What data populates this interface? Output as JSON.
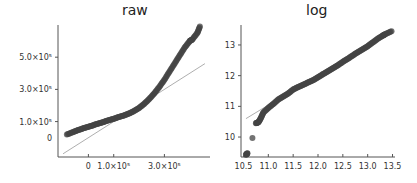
{
  "chart_data": [
    {
      "type": "scatter",
      "title": "raw",
      "subtype": "qq-plot",
      "xlabel": "",
      "ylabel": "",
      "xticks": [
        {
          "label": "0",
          "value": 0
        },
        {
          "label": "1.0×10⁵",
          "value": 100000
        },
        {
          "label": "3.0×10⁵",
          "value": 300000
        }
      ],
      "yticks": [
        {
          "label": "0",
          "value": 0
        },
        {
          "label": "1.0×10⁵",
          "value": 100000
        },
        {
          "label": "3.0×10⁵",
          "value": 300000
        },
        {
          "label": "5.0×10⁵",
          "value": 500000
        }
      ],
      "xlim": [
        -120000,
        480000
      ],
      "ylim": [
        -120000,
        700000
      ],
      "reference_line": {
        "x": [
          -100000,
          460000
        ],
        "y": [
          -100000,
          460000
        ]
      },
      "points": {
        "x": [
          -85000,
          -60000,
          -40000,
          -20000,
          0,
          20000,
          40000,
          60000,
          80000,
          100000,
          120000,
          140000,
          160000,
          180000,
          200000,
          220000,
          240000,
          260000,
          280000,
          300000,
          320000,
          340000,
          360000,
          380000,
          400000,
          410000,
          430000,
          440000
        ],
        "y": [
          20000,
          35000,
          48000,
          58000,
          68000,
          78000,
          88000,
          98000,
          108000,
          118000,
          128000,
          138000,
          150000,
          165000,
          185000,
          210000,
          240000,
          275000,
          315000,
          360000,
          410000,
          460000,
          510000,
          560000,
          600000,
          610000,
          650000,
          690000
        ]
      },
      "grid": false
    },
    {
      "type": "scatter",
      "title": "log",
      "subtype": "qq-plot",
      "xlabel": "",
      "ylabel": "",
      "xticks": [
        {
          "label": "10.5",
          "value": 10.5
        },
        {
          "label": "11.0",
          "value": 11.0
        },
        {
          "label": "11.5",
          "value": 11.5
        },
        {
          "label": "12.0",
          "value": 12.0
        },
        {
          "label": "12.5",
          "value": 12.5
        },
        {
          "label": "13.0",
          "value": 13.0
        },
        {
          "label": "13.5",
          "value": 13.5
        }
      ],
      "yticks": [
        {
          "label": "10",
          "value": 10
        },
        {
          "label": "11",
          "value": 11
        },
        {
          "label": "12",
          "value": 12
        },
        {
          "label": "13",
          "value": 13
        }
      ],
      "xlim": [
        10.45,
        13.55
      ],
      "ylim": [
        9.35,
        13.65
      ],
      "reference_line": {
        "x": [
          10.55,
          13.45
        ],
        "y": [
          10.6,
          13.45
        ]
      },
      "points": {
        "x": [
          10.55,
          10.58,
          10.68,
          10.75,
          10.8,
          10.85,
          10.9,
          11.0,
          11.1,
          11.2,
          11.3,
          11.4,
          11.5,
          11.6,
          11.7,
          11.8,
          11.9,
          12.0,
          12.1,
          12.2,
          12.3,
          12.4,
          12.5,
          12.6,
          12.7,
          12.8,
          12.9,
          13.0,
          13.1,
          13.2,
          13.3,
          13.35,
          13.48
        ],
        "y": [
          9.42,
          9.47,
          9.97,
          10.45,
          10.48,
          10.62,
          10.8,
          10.95,
          11.08,
          11.22,
          11.32,
          11.42,
          11.55,
          11.63,
          11.7,
          11.78,
          11.85,
          11.95,
          12.05,
          12.14,
          12.24,
          12.34,
          12.45,
          12.55,
          12.66,
          12.76,
          12.86,
          12.96,
          13.08,
          13.2,
          13.3,
          13.35,
          13.45
        ]
      },
      "grid": false
    }
  ],
  "colors": {
    "points": "#444444",
    "reference_line": "#999999",
    "axis": "#555555"
  }
}
